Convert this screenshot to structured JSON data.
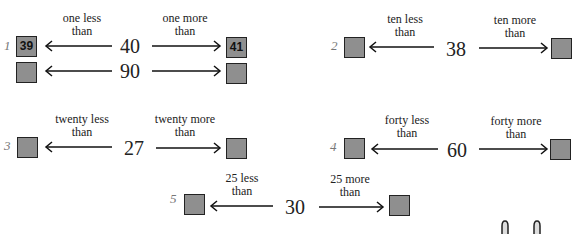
{
  "problems": [
    {
      "number": "1",
      "left_label": [
        "one less",
        "than"
      ],
      "right_label": [
        "one more",
        "than"
      ],
      "rows": [
        {
          "center": "40",
          "left_answer": "39",
          "right_answer": "41"
        },
        {
          "center": "90",
          "left_answer": "",
          "right_answer": ""
        }
      ]
    },
    {
      "number": "2",
      "left_label": [
        "ten less",
        "than"
      ],
      "right_label": [
        "ten more",
        "than"
      ],
      "rows": [
        {
          "center": "38",
          "left_answer": "",
          "right_answer": ""
        }
      ]
    },
    {
      "number": "3",
      "left_label": [
        "twenty less",
        "than"
      ],
      "right_label": [
        "twenty more",
        "than"
      ],
      "rows": [
        {
          "center": "27",
          "left_answer": "",
          "right_answer": ""
        }
      ]
    },
    {
      "number": "4",
      "left_label": [
        "forty less",
        "than"
      ],
      "right_label": [
        "forty more",
        "than"
      ],
      "rows": [
        {
          "center": "60",
          "left_answer": "",
          "right_answer": ""
        }
      ]
    },
    {
      "number": "5",
      "left_label": [
        "25 less",
        "than"
      ],
      "right_label": [
        "25 more",
        "than"
      ],
      "rows": [
        {
          "center": "30",
          "left_answer": "",
          "right_answer": ""
        }
      ]
    }
  ]
}
